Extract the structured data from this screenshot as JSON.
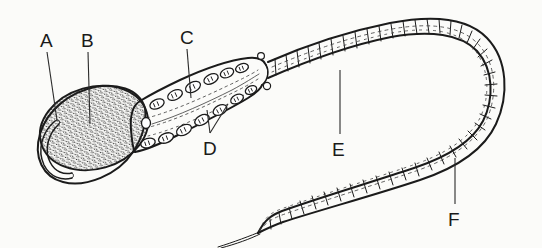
{
  "figure": {
    "background_color": "#fbfbf9",
    "ink_color": "#1b1b1b",
    "style": "black-and-white line drawing"
  },
  "labels": [
    {
      "id": "A",
      "text": "A",
      "x": 44,
      "y": 43,
      "leader_from_x": 47,
      "leader_from_y": 52,
      "leader_to_x": 57,
      "leader_to_y": 120,
      "points_to": "acrosomal-crescent"
    },
    {
      "id": "B",
      "text": "B",
      "x": 85,
      "y": 43,
      "leader_from_x": 88,
      "leader_from_y": 52,
      "leader_to_x": 90,
      "leader_to_y": 124,
      "points_to": "nucleus"
    },
    {
      "id": "C",
      "text": "C",
      "x": 183,
      "y": 40,
      "leader_from_x": 187,
      "leader_from_y": 49,
      "leader_to_x": 191,
      "leader_to_y": 98,
      "points_to": "midpiece-axial-core"
    },
    {
      "id": "D",
      "text": "D",
      "x": 208,
      "y": 151,
      "leader_from_x": 210,
      "leader_from_y": 133,
      "leader_to_x": 207,
      "leader_to_y": 110,
      "points_to": "mitochondria"
    },
    {
      "id": "E",
      "text": "E",
      "x": 337,
      "y": 152,
      "leader_from_x": 340,
      "leader_from_y": 134,
      "leader_to_x": 340,
      "leader_to_y": 70,
      "points_to": "tail-principal-piece"
    },
    {
      "id": "F",
      "text": "F",
      "x": 452,
      "y": 222,
      "leader_from_x": 455,
      "leader_from_y": 204,
      "leader_to_x": 455,
      "leader_to_y": 158,
      "points_to": "tail-lower-segment"
    }
  ],
  "label_d_secondary": {
    "leader_from_x": 210,
    "leader_from_y": 133,
    "leader_to_x": 228,
    "leader_to_y": 104
  },
  "structures": [
    {
      "name": "head-outline",
      "description": "teardrop-shaped head outline enclosing nucleus"
    },
    {
      "name": "acrosomal-crescent",
      "description": "crescent hook on left anterior of head"
    },
    {
      "name": "nucleus",
      "description": "stippled oval nucleus filling the head"
    },
    {
      "name": "midpiece",
      "description": "elongated midpiece with mitochondrial rows"
    },
    {
      "name": "mitochondria",
      "description": "oval mitochondria in two rows along midpiece margins"
    },
    {
      "name": "axial-filament",
      "description": "dotted axial filament running through midpiece"
    },
    {
      "name": "annulus-knobs",
      "description": "small circular knobs at midpiece-tail junction"
    },
    {
      "name": "tail",
      "description": "long segmented flagellum looping right and returning"
    },
    {
      "name": "endpiece",
      "description": "tapered terminal filament of the tail"
    }
  ]
}
